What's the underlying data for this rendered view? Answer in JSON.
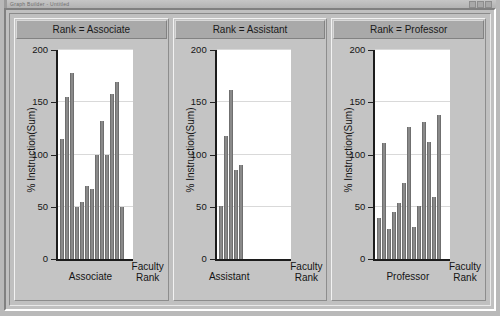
{
  "window": {
    "chrome_title": "Graph Builder - Untitled",
    "accent_bar": "#9b9b9b"
  },
  "chart_data": {
    "type": "bar",
    "title": "",
    "xlabel": "Faculty Rank",
    "ylabel": "% Instruction(Sum)",
    "ylim": [
      0,
      200
    ],
    "yticks": [
      0,
      50,
      100,
      150,
      200
    ],
    "grid": true,
    "legend": "none",
    "facet_variable": "Rank",
    "panels": [
      {
        "title": "Rank = Associate",
        "category": "Associate",
        "values": [
          115,
          155,
          178,
          50,
          55,
          70,
          67,
          100,
          132,
          100,
          158,
          169,
          50
        ]
      },
      {
        "title": "Rank = Assistant",
        "category": "Assistant",
        "values": [
          51,
          118,
          162,
          85,
          90
        ]
      },
      {
        "title": "Rank = Professor",
        "category": "Professor",
        "values": [
          39,
          111,
          29,
          45,
          54,
          73,
          126,
          31,
          51,
          131,
          112,
          59,
          138
        ]
      }
    ]
  }
}
